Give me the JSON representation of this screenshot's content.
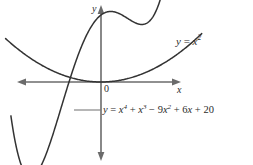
{
  "figure": {
    "kind": "cartesian-graph",
    "background_color": "#ffffff",
    "axis_color": "#6b6b6b",
    "curve_color": "#333333",
    "text_color": "#2b2b2b",
    "leader_color": "#7a7a7a"
  },
  "axes": {
    "y_label": "y",
    "x_label": "x",
    "origin_label": "0",
    "x_axis_y_px": 82,
    "y_axis_x_px": 101,
    "arrowheads": [
      "left",
      "right",
      "up",
      "down"
    ],
    "gridlines": false,
    "tick_labels": []
  },
  "labels": {
    "parabola": {
      "lhs": "y",
      "equals": " = ",
      "base": "x",
      "exponent": "2",
      "full_text": "y = x²"
    },
    "quartic": {
      "full_text": "y = x⁴ + x³ − 9x² + 6x + 20",
      "tokens": [
        {
          "t": "y",
          "italic": true
        },
        {
          "t": " = ",
          "italic": false
        },
        {
          "t": "x",
          "italic": true,
          "sup": "4"
        },
        {
          "t": " + ",
          "italic": false
        },
        {
          "t": "x",
          "italic": true,
          "sup": "3"
        },
        {
          "t": " − 9",
          "italic": false
        },
        {
          "t": "x",
          "italic": true,
          "sup": "2"
        },
        {
          "t": " + 6",
          "italic": false
        },
        {
          "t": "x",
          "italic": true
        },
        {
          "t": " + 20",
          "italic": false
        }
      ]
    }
  },
  "chart_data": {
    "type": "line",
    "title": "",
    "xlabel": "x",
    "ylabel": "y",
    "grid": false,
    "legend": "inline-annotations",
    "xlim": [
      -3.5,
      2.6
    ],
    "ylim": [
      -14,
      26
    ],
    "px_per_x": 26.5,
    "px_per_y": 3.35,
    "series": [
      {
        "name": "y = x²",
        "equation": "y = x^2",
        "color": "#333333",
        "label_text": "y = x²",
        "label_x": 2.85,
        "label_y": 14.0,
        "vertex": [
          0,
          0
        ],
        "x": [
          -3.5,
          -3.2,
          -3.0,
          -2.75,
          -2.5,
          -2.25,
          -2.0,
          -1.75,
          -1.5,
          -1.25,
          -1.0,
          -0.75,
          -0.5,
          -0.25,
          0,
          0.25,
          0.5,
          0.75,
          1.0,
          1.25,
          1.5,
          1.75,
          2.0,
          2.25,
          2.5
        ],
        "y": [
          12.25,
          10.24,
          9.0,
          7.5625,
          6.25,
          5.0625,
          4.0,
          3.0625,
          2.25,
          1.5625,
          1.0,
          0.5625,
          0.25,
          0.0625,
          0,
          0.0625,
          0.25,
          0.5625,
          1.0,
          1.5625,
          2.25,
          3.0625,
          4.0,
          5.0625,
          6.25
        ]
      },
      {
        "name": "y = x⁴ + x³ − 9x² + 6x + 20",
        "equation": "y = x^4 + x^3 - 9x^2 + 6x + 20",
        "color": "#333333",
        "label_text": "y = x⁴ + x³ − 9x² + 6x + 20",
        "label_x": 0.1,
        "label_y": -8.0,
        "local_min_left": [
          -2.32,
          -12.6
        ],
        "local_max": [
          0.34,
          21.1
        ],
        "local_min_right": [
          1.23,
          19.0
        ],
        "x": [
          -3.0,
          -2.8,
          -2.6,
          -2.4,
          -2.2,
          -2.0,
          -1.8,
          -1.6,
          -1.4,
          -1.2,
          -1.0,
          -0.8,
          -0.6,
          -0.4,
          -0.2,
          0,
          0.2,
          0.4,
          0.6,
          0.8,
          1.0,
          1.2,
          1.4,
          1.6,
          1.8,
          2.0,
          2.1
        ],
        "y": [
          -25.0,
          -22.5,
          -18.9,
          -14.4,
          -9.3,
          -4.0,
          1.1,
          5.7,
          9.6,
          12.8,
          15.0,
          16.4,
          17.1,
          17.3,
          17.2,
          20.0,
          20.8,
          21.2,
          20.9,
          20.0,
          19.0,
          18.3,
          18.6,
          20.8,
          26.3,
          36.0,
          42.0
        ]
      }
    ],
    "annotations": [
      {
        "text": "0",
        "x": 0.1,
        "y": -0.6,
        "role": "origin-label"
      },
      {
        "text": "leader-line",
        "from_px": [
          100,
          110
        ],
        "to_px": [
          74,
          110
        ],
        "role": "callout-leader"
      }
    ]
  }
}
